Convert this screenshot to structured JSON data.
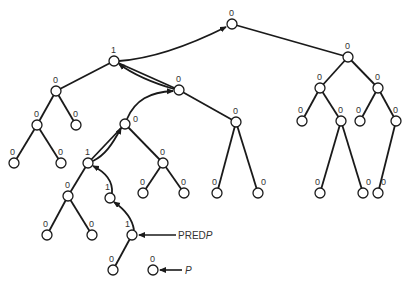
{
  "diagram": {
    "type": "binary-tree",
    "node_radius": 5,
    "colors": {
      "stroke": "#1a1a1a",
      "fill": "#ffffff",
      "text": "#333333"
    },
    "nodes": [
      {
        "id": "n_root",
        "x": 232,
        "y": 24,
        "label": "0",
        "lx": -3,
        "ly": -8
      },
      {
        "id": "n_a",
        "x": 114,
        "y": 61,
        "label": "1",
        "lx": -3,
        "ly": -8
      },
      {
        "id": "n_b",
        "x": 56,
        "y": 91,
        "label": "0",
        "lx": -3,
        "ly": -8
      },
      {
        "id": "n_c",
        "x": 37,
        "y": 125,
        "label": "0",
        "lx": -3,
        "ly": -8
      },
      {
        "id": "n_d",
        "x": 76,
        "y": 125,
        "label": "0",
        "lx": -3,
        "ly": -8
      },
      {
        "id": "n_e",
        "x": 14,
        "y": 163,
        "label": "0",
        "lx": -4,
        "ly": -8
      },
      {
        "id": "n_f",
        "x": 61,
        "y": 163,
        "label": "0",
        "lx": -3,
        "ly": -8
      },
      {
        "id": "n_g",
        "x": 179,
        "y": 90,
        "label": "0",
        "lx": -3,
        "ly": -8
      },
      {
        "id": "n_h",
        "x": 125,
        "y": 124,
        "label": "0",
        "lx": 8,
        "ly": -2
      },
      {
        "id": "n_i",
        "x": 236,
        "y": 122,
        "label": "0",
        "lx": -3,
        "ly": -8
      },
      {
        "id": "n_j",
        "x": 88,
        "y": 163,
        "label": "1",
        "lx": -3,
        "ly": -8
      },
      {
        "id": "n_k",
        "x": 163,
        "y": 163,
        "label": "0",
        "lx": -3,
        "ly": -8
      },
      {
        "id": "n_l",
        "x": 68,
        "y": 196,
        "label": "0",
        "lx": -3,
        "ly": -8
      },
      {
        "id": "n_m",
        "x": 110,
        "y": 198,
        "label": "1",
        "lx": -5,
        "ly": -8
      },
      {
        "id": "n_n",
        "x": 143,
        "y": 193,
        "label": "0",
        "lx": -3,
        "ly": -8
      },
      {
        "id": "n_o",
        "x": 184,
        "y": 193,
        "label": "0",
        "lx": -3,
        "ly": -8
      },
      {
        "id": "n_p",
        "x": 47,
        "y": 235,
        "label": "0",
        "lx": -4,
        "ly": -8
      },
      {
        "id": "n_q",
        "x": 92,
        "y": 235,
        "label": "0",
        "lx": -3,
        "ly": -8
      },
      {
        "id": "n_r",
        "x": 132,
        "y": 235,
        "label": "1",
        "lx": -7,
        "ly": -8
      },
      {
        "id": "n_s",
        "x": 113,
        "y": 270,
        "label": "0",
        "lx": -4,
        "ly": -8
      },
      {
        "id": "n_t",
        "x": 153,
        "y": 270,
        "label": "0",
        "lx": -3,
        "ly": -8
      },
      {
        "id": "n_u",
        "x": 217,
        "y": 193,
        "label": "0",
        "lx": -5,
        "ly": -8
      },
      {
        "id": "n_v",
        "x": 258,
        "y": 193,
        "label": "0",
        "lx": 3,
        "ly": -8
      },
      {
        "id": "n_w",
        "x": 348,
        "y": 57,
        "label": "0",
        "lx": -3,
        "ly": -8
      },
      {
        "id": "n_x",
        "x": 320,
        "y": 88,
        "label": "0",
        "lx": -3,
        "ly": -8
      },
      {
        "id": "n_y",
        "x": 378,
        "y": 88,
        "label": "0",
        "lx": -3,
        "ly": -8
      },
      {
        "id": "n_z",
        "x": 302,
        "y": 121,
        "label": "0",
        "lx": -4,
        "ly": -8
      },
      {
        "id": "n_aa",
        "x": 341,
        "y": 121,
        "label": "0",
        "lx": -3,
        "ly": -8
      },
      {
        "id": "n_ab",
        "x": 360,
        "y": 121,
        "label": "0",
        "lx": -4,
        "ly": -8
      },
      {
        "id": "n_ac",
        "x": 396,
        "y": 121,
        "label": "0",
        "lx": -3,
        "ly": -8
      },
      {
        "id": "n_ad",
        "x": 320,
        "y": 193,
        "label": "0",
        "lx": -5,
        "ly": -8
      },
      {
        "id": "n_ae",
        "x": 363,
        "y": 193,
        "label": "0",
        "lx": 3,
        "ly": -8
      },
      {
        "id": "n_af",
        "x": 378,
        "y": 193,
        "label": "0",
        "lx": 3,
        "ly": -8
      }
    ],
    "edges": [
      [
        "n_root",
        "n_w"
      ],
      [
        "n_a",
        "n_b"
      ],
      [
        "n_a",
        "n_g"
      ],
      [
        "n_b",
        "n_c"
      ],
      [
        "n_b",
        "n_d"
      ],
      [
        "n_c",
        "n_e"
      ],
      [
        "n_c",
        "n_f"
      ],
      [
        "n_g",
        "n_i"
      ],
      [
        "n_h",
        "n_j"
      ],
      [
        "n_h",
        "n_k"
      ],
      [
        "n_i",
        "n_u"
      ],
      [
        "n_i",
        "n_v"
      ],
      [
        "n_j",
        "n_l"
      ],
      [
        "n_k",
        "n_n"
      ],
      [
        "n_k",
        "n_o"
      ],
      [
        "n_l",
        "n_p"
      ],
      [
        "n_l",
        "n_q"
      ],
      [
        "n_r",
        "n_s"
      ],
      [
        "n_w",
        "n_x"
      ],
      [
        "n_w",
        "n_y"
      ],
      [
        "n_x",
        "n_z"
      ],
      [
        "n_x",
        "n_aa"
      ],
      [
        "n_aa",
        "n_ad"
      ],
      [
        "n_aa",
        "n_ae"
      ],
      [
        "n_y",
        "n_ab"
      ],
      [
        "n_y",
        "n_ac"
      ],
      [
        "n_ac",
        "n_af"
      ]
    ],
    "thread_arrows": [
      {
        "id": "arrow_a_to_root",
        "from": "n_a",
        "to": "n_root",
        "path": "M119,61 C160,58 200,40 226,27"
      },
      {
        "id": "arrow_g_to_a",
        "from": "n_g",
        "to": "n_a",
        "path": "M174,89 C150,82 130,72 119,64"
      },
      {
        "id": "arrow_h_to_g",
        "from": "n_h",
        "to": "n_g",
        "path": "M127,119 C135,100 150,92 173,91"
      },
      {
        "id": "arrow_j_to_h",
        "from": "n_j",
        "to": "n_h",
        "path": "M93,161 C105,155 112,145 121,128"
      },
      {
        "id": "arrow_m_to_j",
        "from": "n_m",
        "to": "n_j",
        "path": "M112,193 C113,180 105,172 93,166"
      },
      {
        "id": "arrow_r_to_m",
        "from": "n_r",
        "to": "n_m",
        "path": "M134,230 C132,217 124,209 114,202"
      }
    ],
    "pointers": [
      {
        "id": "pointer_predp",
        "label": "PRED",
        "label_italic": "P",
        "target": "n_r",
        "tx": 160,
        "ty": 235,
        "x1": 176,
        "x2": 139
      },
      {
        "id": "pointer_p",
        "label": "",
        "label_italic": "P",
        "target": "n_t",
        "tx": 185,
        "ty": 270,
        "x1": 182,
        "x2": 160
      }
    ]
  }
}
